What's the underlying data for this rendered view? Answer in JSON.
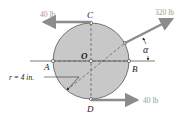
{
  "diagram": {
    "points": {
      "center": "O",
      "top": "C",
      "bottom": "D",
      "left": "A",
      "right": "B"
    },
    "forces": {
      "top": "40 lb",
      "bottom": "40 lb",
      "oblique": "320 lb"
    },
    "angle_label": "α",
    "radius_label": "r = 4 in.",
    "colors": {
      "disk_fill": "#c8c8c8",
      "arrow": "#8c8c8c",
      "line": "#333333"
    }
  }
}
